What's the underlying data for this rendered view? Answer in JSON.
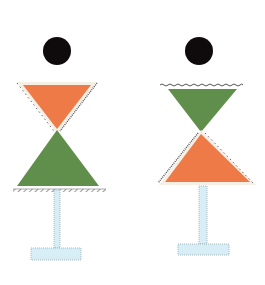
{
  "diagram": {
    "colors": {
      "head": "#0f0a0c",
      "orange": "#ee7a48",
      "green": "#5f8f4a",
      "post_fill": "#d8eef6",
      "post_stroke": "#9aa9b0",
      "hatch": "#555555",
      "outline_white": "#f6efe6"
    },
    "figures": [
      {
        "id": "left",
        "head": {
          "cx": 57,
          "cy": 51,
          "r": 14
        },
        "top_triangle": {
          "color": "orange",
          "orientation": "down",
          "points": "23,85 91,85 57,129"
        },
        "bottom_triangle": {
          "color": "green",
          "orientation": "up",
          "points": "57,130 99,186 17,186"
        },
        "ground_line": {
          "x1": 13,
          "x2": 106,
          "y": 191
        },
        "post": {
          "x": 54,
          "y": 190,
          "w": 6,
          "h": 58
        },
        "foot": {
          "x": 31,
          "y": 248,
          "w": 50,
          "h": 12
        }
      },
      {
        "id": "right",
        "head": {
          "cx": 199,
          "cy": 51,
          "r": 14
        },
        "ground_line": {
          "x1": 160,
          "x2": 243,
          "y": 85
        },
        "top_triangle": {
          "color": "green",
          "orientation": "down",
          "points": "168,89 237,89 201,132"
        },
        "bottom_triangle": {
          "color": "orange",
          "orientation": "up",
          "points": "201,134 250,182 165,182"
        },
        "post": {
          "x": 199,
          "y": 186,
          "w": 8,
          "h": 58
        },
        "foot": {
          "x": 178,
          "y": 244,
          "w": 51,
          "h": 11
        }
      }
    ]
  }
}
